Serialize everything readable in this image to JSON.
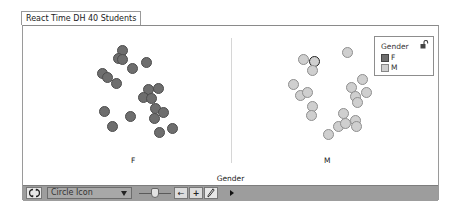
{
  "window": {
    "title": "React Time DH 40 Students"
  },
  "chart_data": {
    "type": "scatter",
    "title": "React Time DH 40 Students",
    "xlabel": "Gender",
    "ylabel": "",
    "categories": [
      "F",
      "M"
    ],
    "grid": false,
    "legend_position": "top-right",
    "legend": {
      "title": "Gender",
      "entries": [
        {
          "label": "F",
          "color": "#6e6e6e"
        },
        {
          "label": "M",
          "color": "#cfcfcf"
        }
      ]
    },
    "series": [
      {
        "name": "F",
        "color": "#6e6e6e",
        "count": 20,
        "points": [
          [
            122,
            50
          ],
          [
            118,
            58
          ],
          [
            122,
            59
          ],
          [
            132,
            68
          ],
          [
            146,
            62
          ],
          [
            102,
            73
          ],
          [
            107,
            77
          ],
          [
            116,
            83
          ],
          [
            148,
            89
          ],
          [
            158,
            88
          ],
          [
            143,
            97
          ],
          [
            151,
            98
          ],
          [
            155,
            108
          ],
          [
            163,
            112
          ],
          [
            154,
            118
          ],
          [
            104,
            111
          ],
          [
            130,
            116
          ],
          [
            112,
            126
          ],
          [
            159,
            132
          ],
          [
            172,
            128
          ]
        ]
      },
      {
        "name": "M",
        "color": "#cfcfcf",
        "count": 20,
        "points": [
          [
            347,
            52
          ],
          [
            303,
            59
          ],
          [
            314,
            61
          ],
          [
            312,
            70
          ],
          [
            293,
            84
          ],
          [
            300,
            95
          ],
          [
            307,
            92
          ],
          [
            312,
            106
          ],
          [
            311,
            115
          ],
          [
            362,
            79
          ],
          [
            351,
            87
          ],
          [
            366,
            92
          ],
          [
            355,
            96
          ],
          [
            357,
            102
          ],
          [
            343,
            113
          ],
          [
            338,
            126
          ],
          [
            345,
            123
          ],
          [
            355,
            120
          ],
          [
            356,
            126
          ],
          [
            328,
            134
          ]
        ]
      }
    ],
    "selected_point": {
      "series": "M",
      "index": 2
    }
  },
  "plot": {
    "x_axis_title": "Gender",
    "category_labels": [
      "F",
      "M"
    ]
  },
  "legend": {
    "title": "Gender",
    "items": [
      {
        "label": "F",
        "color": "#6e6e6e"
      },
      {
        "label": "M",
        "color": "#cfcfcf"
      }
    ]
  },
  "toolbar": {
    "point_style": "Circle Icon",
    "buttons": [
      "refresh",
      "arrow-left",
      "plus",
      "pencil",
      "expand"
    ],
    "arrow_label": "←",
    "plus_label": "+"
  }
}
